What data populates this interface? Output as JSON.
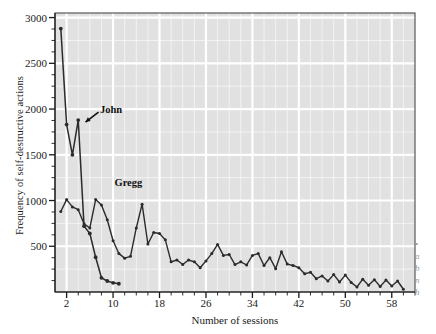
{
  "chart_data": {
    "type": "line",
    "title": "",
    "xlabel": "Number of sessions",
    "ylabel": "Frequency of self-destructive actions",
    "xlim": [
      0,
      62
    ],
    "ylim": [
      0,
      3050
    ],
    "xticks": [
      2,
      10,
      18,
      26,
      34,
      42,
      50,
      58
    ],
    "yticks": [
      500,
      1000,
      1500,
      2000,
      2500,
      3000
    ],
    "minor_ticks": true,
    "grid": true,
    "legend_position": "inline-annotation",
    "annotations": [
      {
        "text": "John",
        "x": 5,
        "y": 1880,
        "arrow": true
      },
      {
        "text": "Gregg",
        "x": 13,
        "y": 1130,
        "arrow": false
      }
    ],
    "series": [
      {
        "name": "John",
        "x": [
          1,
          2,
          3,
          4,
          5,
          6,
          7,
          8,
          9,
          10,
          11
        ],
        "values": [
          2880,
          1830,
          1500,
          1880,
          720,
          640,
          380,
          155,
          120,
          100,
          90
        ]
      },
      {
        "name": "Gregg",
        "x": [
          1,
          2,
          3,
          4,
          5,
          6,
          7,
          8,
          9,
          10,
          11,
          12,
          13,
          14,
          15,
          16,
          17,
          18,
          19,
          20,
          21,
          22,
          23,
          24,
          25,
          26,
          27,
          28,
          29,
          30,
          31,
          32,
          33,
          34,
          35,
          36,
          37,
          38,
          39,
          40,
          41,
          42,
          43,
          44,
          45,
          46,
          47,
          48,
          49,
          50,
          51,
          52,
          53,
          54,
          55,
          56,
          57,
          58,
          59,
          60
        ],
        "values": [
          880,
          1010,
          930,
          900,
          745,
          700,
          1010,
          950,
          790,
          560,
          420,
          370,
          390,
          700,
          960,
          525,
          650,
          640,
          570,
          330,
          350,
          300,
          350,
          330,
          265,
          340,
          420,
          520,
          400,
          410,
          300,
          330,
          295,
          400,
          420,
          290,
          375,
          255,
          440,
          305,
          290,
          265,
          200,
          215,
          145,
          175,
          120,
          190,
          110,
          185,
          105,
          55,
          140,
          75,
          135,
          60,
          130,
          65,
          120,
          30
        ]
      }
    ]
  },
  "edge_caption": {
    "line1": "•",
    "line2": "a",
    "line3": "b",
    "line4": "n",
    "line5": "h"
  }
}
